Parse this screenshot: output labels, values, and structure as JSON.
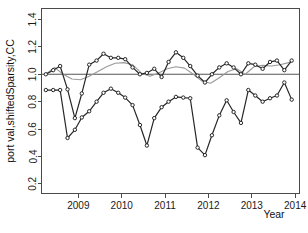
{
  "chart_data": {
    "type": "line",
    "title": "",
    "xlabel": "Year",
    "ylabel": "port val,shiftedSparsity,CC",
    "xlim": [
      2008.15,
      2014.1
    ],
    "ylim": [
      0.13,
      1.48
    ],
    "grid": false,
    "legend": null,
    "y_ticks": [
      0.2,
      0.4,
      0.6,
      0.8,
      1.0,
      1.2,
      1.4
    ],
    "y_tick_labels": [
      "0.2",
      "0.4",
      "0.6",
      "0.8",
      "1.0",
      "1.2",
      "1.4"
    ],
    "x_ticks": [
      2009,
      2010,
      2011,
      2012,
      2013,
      2014
    ],
    "x_tick_labels": [
      "2009",
      "2010",
      "2011",
      "2012",
      "2013",
      "2014"
    ],
    "reference_line": {
      "name": "unit-reference-line",
      "orientation": "horizontal",
      "y": 1.0,
      "color": "#555555"
    },
    "series": [
      {
        "name": "port val",
        "color": "#262626",
        "marker": "circle",
        "x": [
          2008.25,
          2008.42,
          2008.58,
          2008.75,
          2008.92,
          2009.08,
          2009.25,
          2009.42,
          2009.58,
          2009.75,
          2009.92,
          2010.08,
          2010.25,
          2010.42,
          2010.58,
          2010.75,
          2010.92,
          2011.08,
          2011.25,
          2011.42,
          2011.58,
          2011.75,
          2011.92,
          2012.08,
          2012.25,
          2012.42,
          2012.58,
          2012.75,
          2012.92,
          2013.08,
          2013.25,
          2013.42,
          2013.58,
          2013.75,
          2013.92
        ],
        "values": [
          1.0,
          1.03,
          1.06,
          0.89,
          0.68,
          0.86,
          1.07,
          1.1,
          1.15,
          1.12,
          1.12,
          1.11,
          1.05,
          1.0,
          1.01,
          1.04,
          0.98,
          1.09,
          1.16,
          1.12,
          1.06,
          0.99,
          0.94,
          1.0,
          1.05,
          1.08,
          1.05,
          1.0,
          1.08,
          1.07,
          1.04,
          1.09,
          1.1,
          1.03,
          1.1
        ]
      },
      {
        "name": "shiftedSparsity",
        "color": "#262626",
        "marker": "circle",
        "x": [
          2008.25,
          2008.42,
          2008.58,
          2008.75,
          2008.92,
          2009.08,
          2009.25,
          2009.42,
          2009.58,
          2009.75,
          2009.92,
          2010.08,
          2010.25,
          2010.42,
          2010.58,
          2010.75,
          2010.92,
          2011.08,
          2011.25,
          2011.42,
          2011.58,
          2011.75,
          2011.92,
          2012.08,
          2012.25,
          2012.42,
          2012.58,
          2012.75,
          2012.92,
          2013.08,
          2013.25,
          2013.42,
          2013.58,
          2013.75,
          2013.92
        ],
        "values": [
          0.885,
          0.885,
          0.885,
          0.535,
          0.595,
          0.685,
          0.73,
          0.8,
          0.865,
          0.895,
          0.865,
          0.83,
          0.775,
          0.63,
          0.48,
          0.68,
          0.76,
          0.8,
          0.835,
          0.83,
          0.825,
          0.465,
          0.41,
          0.555,
          0.7,
          0.81,
          0.725,
          0.645,
          0.885,
          0.845,
          0.8,
          0.825,
          0.845,
          0.94,
          0.815
        ]
      },
      {
        "name": "CC",
        "color": "#9a9a9a",
        "marker": "none",
        "x": [
          2008.25,
          2008.45,
          2008.65,
          2008.85,
          2009.05,
          2009.25,
          2009.45,
          2009.65,
          2009.85,
          2010.05,
          2010.25,
          2010.45,
          2010.65,
          2010.85,
          2011.05,
          2011.25,
          2011.45,
          2011.65,
          2011.85,
          2012.05,
          2012.25,
          2012.45,
          2012.65,
          2012.85,
          2013.05,
          2013.25,
          2013.45,
          2013.65,
          2013.85,
          2013.92
        ],
        "values": [
          1.0,
          1.05,
          1.0,
          0.965,
          0.96,
          0.985,
          1.02,
          1.055,
          1.08,
          1.085,
          1.07,
          1.01,
          0.985,
          1.01,
          1.04,
          1.055,
          1.045,
          1.0,
          0.95,
          0.935,
          0.975,
          1.02,
          1.04,
          1.0,
          1.055,
          1.065,
          1.06,
          1.07,
          1.085,
          1.1
        ]
      }
    ]
  },
  "axis": {
    "y_label": "port val,shiftedSparsity,CC",
    "x_label": "Year"
  }
}
